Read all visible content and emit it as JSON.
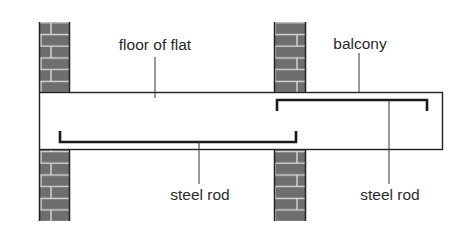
{
  "diagram": {
    "labels": {
      "floor": "floor of flat",
      "balcony": "balcony",
      "rod_lower": "steel rod",
      "rod_upper": "steel rod"
    },
    "colors": {
      "brick": "#6e6e6e",
      "mortar": "#d8d8d8",
      "line": "#222222",
      "background": "#ffffff"
    }
  }
}
